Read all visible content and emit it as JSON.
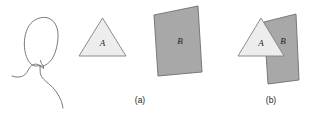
{
  "figure": {
    "background_color": "#ffffff",
    "observer": {
      "name": "head-and-shoulders-silhouette",
      "description": "outline drawing of a person's head and shoulders viewed from behind",
      "stroke_color": "#6b6b6b",
      "stroke_width": 0.9,
      "fill": "none"
    },
    "panels": [
      {
        "id": "a",
        "caption": "(a)",
        "caption_x": 140,
        "caption_y": 103,
        "shapes": [
          {
            "label": "A",
            "name": "triangle-a",
            "type": "triangle",
            "fill_color": "#ededed",
            "stroke_color": "#808080",
            "stroke_width": 0.9,
            "points": "102.5,18 126,56 79,56",
            "label_x": 102.5,
            "label_y": 46
          },
          {
            "label": "B",
            "name": "quadrilateral-b",
            "type": "quadrilateral",
            "fill_color": "#a8a8a8",
            "stroke_color": "#6e6e6e",
            "stroke_width": 0.9,
            "points": "154,15 198,6 202,72 158,76",
            "label_x": 180,
            "label_y": 44
          }
        ]
      },
      {
        "id": "b",
        "caption": "(b)",
        "caption_x": 271,
        "caption_y": 103,
        "shapes": [
          {
            "label": "B",
            "name": "quadrilateral-b-overlapped",
            "type": "quadrilateral",
            "type_order": "behind",
            "fill_color": "#a8a8a8",
            "stroke_color": "#6e6e6e",
            "stroke_width": 0.9,
            "points": "264,22 296,14 299,80 268,84",
            "label_x": 283,
            "label_y": 44
          },
          {
            "label": "A",
            "name": "triangle-a-overlapping",
            "type": "triangle",
            "type_order": "front",
            "fill_color": "#ededed",
            "stroke_color": "#808080",
            "stroke_width": 0.9,
            "points": "261,18 284,56 238,56",
            "label_x": 261,
            "label_y": 46
          }
        ]
      }
    ]
  }
}
